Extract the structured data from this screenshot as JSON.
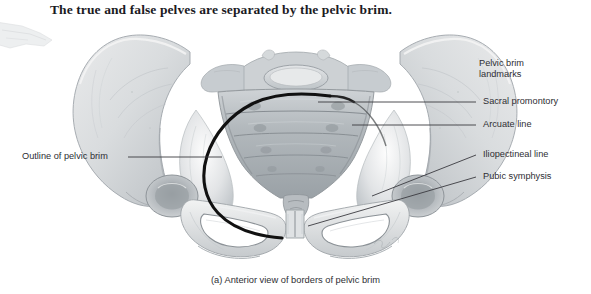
{
  "figure": {
    "title": "The true and false pelves are separated by the pelvic brim.",
    "caption": "(a) Anterior view of borders of pelvic brim",
    "illustration_name": "anterior-view-of-bony-pelvis",
    "colors": {
      "bone_light": "#eceded",
      "bone_mid": "#d3d6d8",
      "bone_shadow": "#a8adb1",
      "brim_outline": "#111111",
      "leader_line": "#3a3a3f",
      "text": "#2e2e33",
      "title_text": "#1b1b1f",
      "background": "#ffffff"
    }
  },
  "labels": {
    "left": [
      {
        "text": "Outline of pelvic brim",
        "name": "label-outline-of-pelvic-brim"
      }
    ],
    "right_header": {
      "line1": "Pelvic brim",
      "line2": "landmarks",
      "name": "label-pelvic-brim-landmarks"
    },
    "right": [
      {
        "text": "Sacral promontory",
        "name": "label-sacral-promontory"
      },
      {
        "text": "Arcuate line",
        "name": "label-arcuate-line"
      },
      {
        "text": "Iliopectineal line",
        "name": "label-iliopectineal-line"
      },
      {
        "text": "Pubic symphysis",
        "name": "label-pubic-symphysis"
      }
    ]
  },
  "anatomy_parts": [
    "left-ilium",
    "right-ilium",
    "sacrum",
    "sacral-promontory",
    "coccyx",
    "left-obturator-foramen",
    "right-obturator-foramen",
    "pubic-symphysis",
    "left-ischium",
    "right-ischium",
    "left-acetabulum",
    "right-acetabulum",
    "pelvic-brim-outline"
  ],
  "signature": {
    "text": "",
    "name": "artist-signature"
  }
}
